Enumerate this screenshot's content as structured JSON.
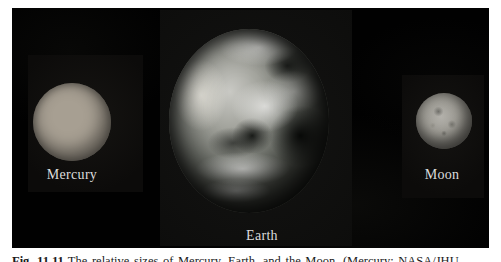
{
  "figure": {
    "background": "#010101",
    "tile_background": "#0c0b0a",
    "bodies": [
      {
        "id": "mercury",
        "label": "Mercury"
      },
      {
        "id": "earth",
        "label": "Earth"
      },
      {
        "id": "moon",
        "label": "Moon"
      }
    ]
  },
  "caption": {
    "figure_number": "Fig. 11.11",
    "text": "The relative sizes of Mercury, Earth, and the Moon. (Mercury: NASA/JHU"
  },
  "colors": {
    "page_background": "#ffffff",
    "label_text": "#dcdcdc",
    "caption_text": "#1a1a1a",
    "mercury_surface": "#b8b1a4",
    "earth_clouds": "#e8e8e6",
    "earth_dark": "#23251f",
    "moon_surface": "#8f8d86"
  }
}
